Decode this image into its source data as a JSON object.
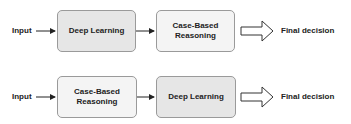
{
  "rows": [
    {
      "input_label": "Input",
      "first_box": "Deep Learning",
      "second_box_line1": "Case-Based",
      "second_box_line2": "Reasoning",
      "output_label": "Final decision"
    },
    {
      "input_label": "Input",
      "first_box_line1": "Case-Based",
      "first_box_line2": "Reasoning",
      "second_box": "Deep Learning",
      "output_label": "Final decision"
    }
  ],
  "colors": {
    "deep_learning_fill": "#e6e6e6",
    "case_based_fill": "#f4f4f4",
    "border": "#9a9a9a",
    "text": "#222222"
  }
}
